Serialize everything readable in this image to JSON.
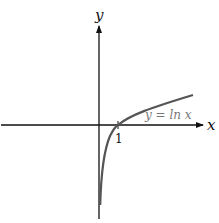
{
  "diagram": {
    "axes": {
      "x_label": "x",
      "y_label": "y"
    },
    "tick_labels": {
      "x_one": "1"
    },
    "curve": {
      "label": "y = ln x",
      "function": "ln(x)",
      "color": "#555555"
    },
    "colors": {
      "axis": "#111111",
      "curve": "#555555",
      "curve_label": "#777777"
    }
  }
}
